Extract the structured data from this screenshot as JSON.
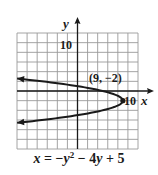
{
  "chart_data": {
    "type": "line",
    "title": "",
    "equation": "x = −y² − 4y + 5",
    "equation_parts": {
      "lhs": "x",
      "eq": " = −",
      "y1": "y",
      "exp": "2",
      "mid": " − 4",
      "y2": "y",
      "tail": " + 5"
    },
    "xlabel": "x",
    "ylabel": "y",
    "xlim": [
      -12,
      12
    ],
    "ylim": [
      -12,
      12
    ],
    "grid": true,
    "grid_step": 2,
    "tick_labels": {
      "x": [
        {
          "value": 10,
          "label": "10"
        }
      ],
      "y": [
        {
          "value": 10,
          "label": "10"
        }
      ]
    },
    "series": [
      {
        "name": "parabola",
        "relation": "x = -y^2 - 4y + 5",
        "points": [
          {
            "x": -12,
            "y": 2.58
          },
          {
            "x": -7,
            "y": 2
          },
          {
            "x": 0,
            "y": 1
          },
          {
            "x": 5,
            "y": 0
          },
          {
            "x": 8,
            "y": -1
          },
          {
            "x": 9,
            "y": -2
          },
          {
            "x": 8,
            "y": -3
          },
          {
            "x": 5,
            "y": -4
          },
          {
            "x": 0,
            "y": -5
          },
          {
            "x": -7,
            "y": -6
          },
          {
            "x": -12,
            "y": -6.58
          }
        ],
        "arrows_at_ends": true
      }
    ],
    "annotations": [
      {
        "text": "(9, −2)",
        "x": 9,
        "y": -2,
        "marker": "dot"
      }
    ]
  },
  "colors": {
    "grid": "#9a9a9a",
    "axis": "#1a1a1a",
    "curve": "#1a1a1a",
    "background": "#ffffff"
  }
}
